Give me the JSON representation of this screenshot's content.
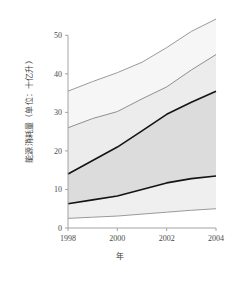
{
  "chart_data": {
    "type": "area",
    "title": "",
    "xlabel": "年",
    "ylabel": "能源消耗量（单位：十亿升）",
    "xlim": [
      1998,
      2004
    ],
    "ylim": [
      0,
      55
    ],
    "grid": false,
    "legend_position": "none",
    "x": [
      1998,
      1999,
      2000,
      2001,
      2002,
      2003,
      2004
    ],
    "xticks": [
      1998,
      2000,
      2002,
      2004
    ],
    "xtick_labels": [
      "1998",
      "2000",
      "2002",
      "2004"
    ],
    "yticks": [
      0,
      10,
      20,
      30,
      40,
      50
    ],
    "ytick_labels": [
      "0",
      "10",
      "20",
      "30",
      "40",
      "50"
    ],
    "series": [
      {
        "name": "outer-upper",
        "style": "gray-line",
        "color": "#9a9a9a",
        "values": [
          35.5,
          38.0,
          40.3,
          43.0,
          46.8,
          51.0,
          54.2
        ]
      },
      {
        "name": "inner-upper",
        "style": "gray-line",
        "color": "#8f8f8f",
        "values": [
          26.0,
          28.4,
          30.2,
          33.5,
          36.6,
          41.0,
          45.0
        ]
      },
      {
        "name": "median-upper",
        "style": "black-line",
        "color": "#141414",
        "values": [
          14.0,
          17.5,
          21.0,
          25.2,
          29.5,
          32.6,
          35.5
        ]
      },
      {
        "name": "median-lower",
        "style": "black-line",
        "color": "#141414",
        "values": [
          6.3,
          7.3,
          8.3,
          10.0,
          11.7,
          12.8,
          13.5
        ]
      },
      {
        "name": "outer-lower",
        "style": "gray-line",
        "color": "#9a9a9a",
        "values": [
          2.5,
          2.8,
          3.1,
          3.6,
          4.1,
          4.6,
          5.0
        ]
      }
    ],
    "bands": [
      {
        "name": "outer-upper-band",
        "lower": "inner-upper",
        "upper": "outer-upper",
        "fill": "#f6f6f6"
      },
      {
        "name": "mid-upper-band",
        "lower": "median-upper",
        "upper": "inner-upper",
        "fill": "#ececec"
      },
      {
        "name": "core-band",
        "lower": "median-lower",
        "upper": "median-upper",
        "fill": "#dcdcdc"
      },
      {
        "name": "outer-lower-band",
        "lower": "outer-lower",
        "upper": "median-lower",
        "fill": "#efefef"
      }
    ],
    "colors": {
      "band_core": "#dcdcdc",
      "band_mid": "#ececec",
      "band_outer": "#f6f6f6",
      "line_black": "#141414",
      "line_gray": "#9a9a9a",
      "axis": "#9a9a9a"
    }
  }
}
